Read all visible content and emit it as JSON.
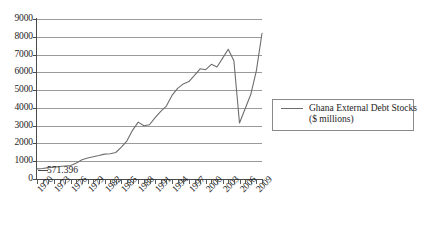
{
  "chart_data": {
    "type": "line",
    "title": "",
    "subtitle": "",
    "xlabel": "",
    "ylabel": "",
    "ylim": [
      0,
      9000
    ],
    "xlim": [
      1970,
      2010
    ],
    "y_ticks": [
      0,
      1000,
      2000,
      3000,
      4000,
      5000,
      6000,
      7000,
      8000,
      9000
    ],
    "y_tick_labels": [
      "0",
      "1000",
      "2000",
      "3000",
      "4000",
      "5000",
      "6000",
      "7000",
      "8000",
      "9000"
    ],
    "x_tick_labels": [
      "1970",
      "1973",
      "1976",
      "1979",
      "1982",
      "1985",
      "1988",
      "1991",
      "1994",
      "1997",
      "2000",
      "2003",
      "2006",
      "2009"
    ],
    "x_tick_label_step": 3,
    "x_minor_ticks_every": 1,
    "grid": "horizontal",
    "legend_position": "right",
    "legend": [
      {
        "name_line1": "Ghana External Debt Stocks",
        "name_line2": "($ millions)",
        "color": "#6e6e6e"
      }
    ],
    "annotations": [
      {
        "text": "571.396",
        "x": 1970,
        "y": 571.396
      }
    ],
    "series": [
      {
        "name": "Ghana External Debt Stocks ($ millions)",
        "color": "#6e6e6e",
        "x": [
          1970,
          1971,
          1972,
          1973,
          1974,
          1975,
          1976,
          1977,
          1978,
          1979,
          1980,
          1981,
          1982,
          1983,
          1984,
          1985,
          1986,
          1987,
          1988,
          1989,
          1990,
          1991,
          1992,
          1993,
          1994,
          1995,
          1996,
          1997,
          1998,
          1999,
          2000,
          2001,
          2002,
          2003,
          2004,
          2005,
          2006,
          2007,
          2008,
          2009,
          2010
        ],
        "values": [
          571,
          590,
          640,
          660,
          700,
          730,
          760,
          900,
          1080,
          1180,
          1250,
          1320,
          1400,
          1420,
          1490,
          1790,
          2150,
          2750,
          3200,
          3000,
          3050,
          3450,
          3800,
          4100,
          4700,
          5100,
          5350,
          5480,
          5830,
          6200,
          6150,
          6450,
          6300,
          6800,
          7300,
          6650,
          3150,
          3950,
          4750,
          6100,
          8200
        ]
      }
    ]
  }
}
